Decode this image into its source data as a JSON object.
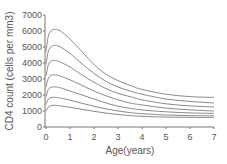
{
  "chart_data": {
    "type": "line",
    "title": "",
    "xlabel": "Age(years)",
    "ylabel": "CD4 count (cells per mm3)",
    "xlim": [
      0,
      7
    ],
    "ylim": [
      0,
      7000
    ],
    "xticks": [
      "0",
      "1",
      "2",
      "3",
      "4",
      "5",
      "6",
      "7"
    ],
    "yticks": [
      "0",
      "1000",
      "2000",
      "3000",
      "4000",
      "5000",
      "6000",
      "7000"
    ],
    "grid": false,
    "legend": null,
    "x": [
      0,
      0.1,
      0.25,
      0.4,
      0.6,
      1,
      1.5,
      2,
      2.5,
      3,
      3.5,
      4,
      5,
      6,
      7
    ],
    "series": [
      {
        "name": "curve-1",
        "values": [
          4700,
          5700,
          6050,
          6100,
          6000,
          5500,
          4700,
          3900,
          3300,
          2900,
          2600,
          2350,
          2050,
          1900,
          1850
        ]
      },
      {
        "name": "curve-2",
        "values": [
          3900,
          4750,
          5050,
          5100,
          5000,
          4600,
          3950,
          3350,
          2850,
          2500,
          2250,
          2050,
          1750,
          1600,
          1500
        ]
      },
      {
        "name": "curve-3",
        "values": [
          3200,
          3900,
          4150,
          4150,
          4050,
          3750,
          3250,
          2800,
          2400,
          2100,
          1900,
          1700,
          1450,
          1320,
          1250
        ]
      },
      {
        "name": "curve-4",
        "values": [
          2500,
          3050,
          3250,
          3250,
          3180,
          2950,
          2600,
          2250,
          1950,
          1700,
          1500,
          1380,
          1180,
          1070,
          1000
        ]
      },
      {
        "name": "curve-5",
        "values": [
          1900,
          2350,
          2500,
          2500,
          2450,
          2250,
          2000,
          1750,
          1500,
          1300,
          1170,
          1070,
          950,
          880,
          850
        ]
      },
      {
        "name": "curve-6",
        "values": [
          1400,
          1750,
          1850,
          1850,
          1800,
          1680,
          1480,
          1300,
          1130,
          1000,
          900,
          830,
          750,
          710,
          700
        ]
      },
      {
        "name": "curve-7",
        "values": [
          1000,
          1250,
          1350,
          1350,
          1320,
          1230,
          1100,
          980,
          870,
          780,
          710,
          670,
          620,
          600,
          600
        ]
      }
    ]
  },
  "colors": {
    "curve": "#8a8a8a",
    "axis": "#777777",
    "text": "#555555"
  }
}
